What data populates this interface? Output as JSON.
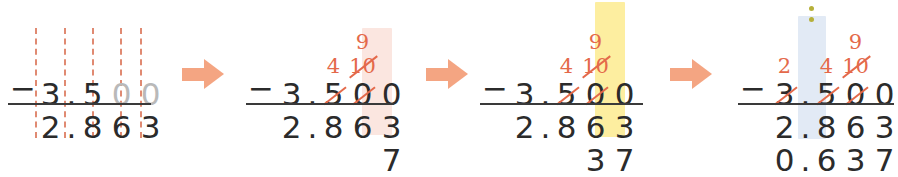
{
  "figure": {
    "kind": "worked-example-column-subtraction",
    "problem": {
      "minuend": "3.500",
      "subtrahend": "2.863",
      "difference": "0.637"
    },
    "accent_colors": {
      "arrow": "#f4a582",
      "annotation": "#e4694a",
      "dashed_guide": "#e08a72",
      "highlight_pink": "#fbe6e0",
      "highlight_yellow": "#fdeea0",
      "highlight_blue": "#e2eaf5",
      "dots": "#b6b03a",
      "ink": "#2b2b2b",
      "faint_ink": "#b9b9b9"
    }
  },
  "steps": [
    {
      "id": "step-1",
      "caption": "",
      "minuend": [
        "3",
        ".",
        "5",
        "0",
        "0"
      ],
      "minuend_faint": [
        false,
        false,
        false,
        true,
        true
      ],
      "subtrahend": [
        "2",
        ".",
        "8",
        "6",
        "3"
      ],
      "difference": [
        "",
        "",
        "",
        "",
        ""
      ],
      "annotations_top": [
        "",
        "",
        "",
        "",
        ""
      ],
      "annotations_mid": [
        "",
        "",
        "",
        "",
        ""
      ],
      "struck_minuend": [
        false,
        false,
        false,
        false,
        false
      ],
      "highlight": "none",
      "dashed_guides": true
    },
    {
      "id": "step-2",
      "caption": "",
      "minuend": [
        "3",
        ".",
        "5",
        "0",
        "0"
      ],
      "minuend_faint": [
        false,
        false,
        false,
        false,
        false
      ],
      "subtrahend": [
        "2",
        ".",
        "8",
        "6",
        "3"
      ],
      "difference": [
        "",
        "",
        "",
        "",
        "7"
      ],
      "annotations_top": [
        "",
        "",
        "",
        "9",
        ""
      ],
      "annotations_mid": [
        "",
        "",
        "4",
        "10",
        ""
      ],
      "struck_minuend": [
        false,
        false,
        true,
        true,
        false
      ],
      "struck_annotations_mid": [
        false,
        false,
        false,
        true,
        false
      ],
      "highlight": "pink",
      "highlight_column": 4,
      "dashed_guides": false
    },
    {
      "id": "step-3",
      "caption": "",
      "minuend": [
        "3",
        ".",
        "5",
        "0",
        "0"
      ],
      "minuend_faint": [
        false,
        false,
        false,
        false,
        false
      ],
      "subtrahend": [
        "2",
        ".",
        "8",
        "6",
        "3"
      ],
      "difference": [
        "",
        "",
        "",
        "3",
        "7"
      ],
      "annotations_top": [
        "",
        "",
        "",
        "9",
        ""
      ],
      "annotations_mid": [
        "",
        "",
        "4",
        "10",
        ""
      ],
      "struck_minuend": [
        false,
        false,
        true,
        true,
        false
      ],
      "struck_annotations_mid": [
        false,
        false,
        false,
        true,
        false
      ],
      "highlight": "yellow",
      "highlight_column": 3,
      "dashed_guides": false
    },
    {
      "id": "step-4",
      "caption": "",
      "minuend": [
        "3",
        ".",
        "5",
        "0",
        "0"
      ],
      "minuend_faint": [
        false,
        false,
        false,
        false,
        false
      ],
      "subtrahend": [
        "2",
        ".",
        "8",
        "6",
        "3"
      ],
      "difference": [
        "0",
        ".",
        "6",
        "3",
        "7"
      ],
      "annotations_top": [
        "",
        "",
        "",
        "9",
        ""
      ],
      "annotations_mid": [
        "2",
        "",
        "4",
        "10",
        ""
      ],
      "struck_minuend": [
        true,
        false,
        true,
        true,
        false
      ],
      "struck_annotations_mid": [
        false,
        false,
        false,
        true,
        false
      ],
      "highlight": "blue",
      "highlight_column": 2,
      "dashed_guides": false,
      "dots_marker": {
        "count": 2,
        "column": 2
      }
    }
  ],
  "arrows": [
    {
      "id": "arrow-1",
      "glyph": "right-arrow"
    },
    {
      "id": "arrow-2",
      "glyph": "right-arrow"
    },
    {
      "id": "arrow-3",
      "glyph": "right-arrow"
    }
  ]
}
